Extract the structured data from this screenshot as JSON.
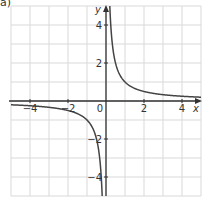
{
  "part_label": "a)",
  "chart_data": {
    "type": "line",
    "title": "",
    "function": "y = 1/x",
    "xlabel": "x",
    "ylabel": "y",
    "xlim": [
      -5,
      5
    ],
    "ylim": [
      -5,
      5
    ],
    "grid": true,
    "grid_step": 1,
    "x_ticks": [
      -4,
      -2,
      0,
      2,
      4
    ],
    "x_tick_labels": [
      "−4",
      "−2",
      "0",
      "2",
      "4"
    ],
    "y_ticks": [
      4,
      2,
      -2,
      -4
    ],
    "y_tick_labels": [
      "4",
      "2",
      "−2",
      "−4"
    ],
    "origin_label": "0",
    "series": [
      {
        "name": "y = 1/x (x < 0)",
        "x": [
          -5,
          -4,
          -3,
          -2,
          -1.5,
          -1,
          -0.75,
          -0.5,
          -0.35,
          -0.25,
          -0.2
        ],
        "y": [
          -0.2,
          -0.25,
          -0.333,
          -0.5,
          -0.667,
          -1,
          -1.333,
          -2,
          -2.857,
          -4,
          -5
        ]
      },
      {
        "name": "y = 1/x (x > 0)",
        "x": [
          0.2,
          0.25,
          0.35,
          0.5,
          0.75,
          1,
          1.5,
          2,
          3,
          4,
          5
        ],
        "y": [
          5,
          4,
          2.857,
          2,
          1.333,
          1,
          0.667,
          0.5,
          0.333,
          0.25,
          0.2
        ]
      }
    ],
    "colors": {
      "grid": "#d9d9d9",
      "axis": "#333333",
      "curve": "#444444",
      "text": "#333333"
    }
  }
}
